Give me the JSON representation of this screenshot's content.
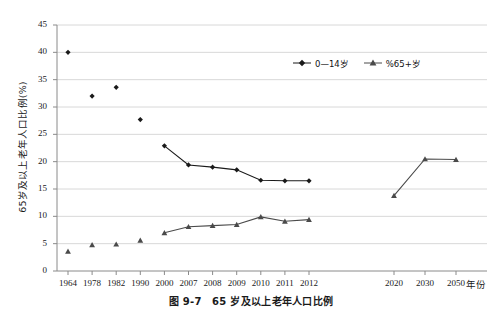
{
  "figure": {
    "caption": "图 9-7　65 岁及以上老年人口比例",
    "width": 502,
    "height": 316
  },
  "chart_data": {
    "type": "line",
    "title": "",
    "xlabel": "年份",
    "ylabel": "65岁及以上老年人口比例(%)",
    "ylim": [
      0,
      45
    ],
    "ytick_step": 5,
    "yticks": [
      "0",
      "5",
      "10",
      "15",
      "20",
      "25",
      "30",
      "35",
      "40",
      "45"
    ],
    "grid": "horizontal",
    "legend_position": "top-right",
    "categories": [
      "1964",
      "1978",
      "1982",
      "1990",
      "2000",
      "2007",
      "2008",
      "2009",
      "2010",
      "2011",
      "2012",
      "",
      "2020",
      "2030",
      "2050"
    ],
    "series": [
      {
        "name": "0—14岁",
        "marker": "diamond",
        "color": "#1a1a1a",
        "values": [
          40.0,
          32.0,
          33.6,
          27.7,
          22.9,
          19.4,
          19.0,
          18.5,
          16.6,
          16.5,
          16.5,
          null,
          null,
          null,
          null
        ]
      },
      {
        "name": "%65+岁",
        "marker": "triangle",
        "color": "#4a4a4a",
        "values": [
          3.6,
          4.8,
          4.9,
          5.6,
          7.0,
          8.1,
          8.3,
          8.5,
          9.9,
          9.1,
          9.4,
          null,
          13.8,
          20.5,
          20.4
        ]
      }
    ],
    "connected_from_index": 4,
    "right_block_start_index": 12
  },
  "legend": {
    "items": [
      {
        "label": "0—14岁",
        "marker": "diamond"
      },
      {
        "label": "%65+岁",
        "marker": "triangle"
      }
    ]
  }
}
